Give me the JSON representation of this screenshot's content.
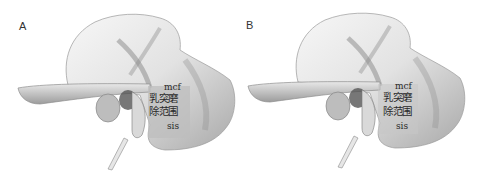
{
  "figure": {
    "type": "anatomical-illustration",
    "panels": [
      {
        "letter": "A",
        "labels": {
          "mcf": "mcf",
          "region_line1": "乳突磨",
          "region_line2": "除范围",
          "sis": "sis"
        }
      },
      {
        "letter": "B",
        "labels": {
          "mcf": "mcf",
          "region_line1": "乳突磨",
          "region_line2": "除范围",
          "sis": "sis"
        }
      }
    ]
  },
  "colors": {
    "background": "#ffffff",
    "bone_light": "#f2f2f2",
    "bone_mid": "#cfcfcf",
    "bone_dark": "#8a8a8a",
    "shaded_region": "#bdbdbd",
    "outline": "#9a9a9a",
    "label_text": "#2a2a2a"
  }
}
